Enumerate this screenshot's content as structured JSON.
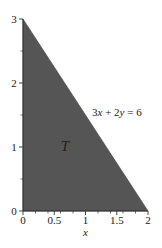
{
  "diagram": {
    "region_label": "T",
    "line_equation": {
      "parts": [
        "3",
        "x",
        " + 2",
        "y",
        " = 6"
      ]
    },
    "x_axis": {
      "label": "x",
      "ticks": [
        "0",
        "0.5",
        "1",
        "1.5",
        "2"
      ],
      "range": [
        0,
        2
      ]
    },
    "y_axis": {
      "ticks": [
        "0",
        "1",
        "2",
        "3"
      ],
      "range": [
        0,
        3
      ]
    },
    "region_fill": "#555555",
    "axis_color": "#333333"
  }
}
